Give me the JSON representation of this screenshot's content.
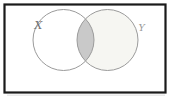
{
  "diagram": {
    "type": "venn",
    "sets": [
      {
        "label": "X"
      },
      {
        "label": "Y"
      }
    ],
    "shaded_region": "intersection",
    "colors": {
      "canvas": "#ffffff",
      "frame_border": "#1a1a1a",
      "frame_shadow": "#d8d8d8",
      "circle_stroke": "#9b9b9b",
      "set_y_fill": "#f6f6f2",
      "intersection_fill": "#c9c9c9",
      "label_x": "#707070",
      "label_y": "#9a9a9a"
    }
  }
}
